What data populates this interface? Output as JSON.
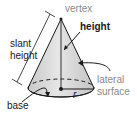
{
  "diagram": {
    "labels": {
      "vertex": "vertex",
      "height": "height",
      "slant_height_line1": "slant",
      "slant_height_line2": "height",
      "lateral_surface_line1": "lateral",
      "lateral_surface_line2": "surface",
      "base": "base",
      "radius": "r"
    },
    "colors": {
      "cone_fill": "#d9d9d9",
      "cone_shade": "#bdbdbd",
      "outline": "#1a1a1a",
      "grey_label": "#8a8a8a",
      "dark_label": "#1a1a1a"
    }
  }
}
